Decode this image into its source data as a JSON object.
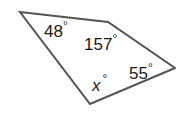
{
  "figure": {
    "shape": "quadrilateral",
    "stroke_color": "#555555",
    "vertices": [
      [
        20,
        12
      ],
      [
        108,
        22
      ],
      [
        175,
        68
      ],
      [
        90,
        104
      ]
    ],
    "angles": [
      {
        "label": "48",
        "unit": "°"
      },
      {
        "label": "157",
        "unit": "°"
      },
      {
        "label": "55",
        "unit": "°"
      },
      {
        "label": "x",
        "unit": "°"
      }
    ]
  }
}
